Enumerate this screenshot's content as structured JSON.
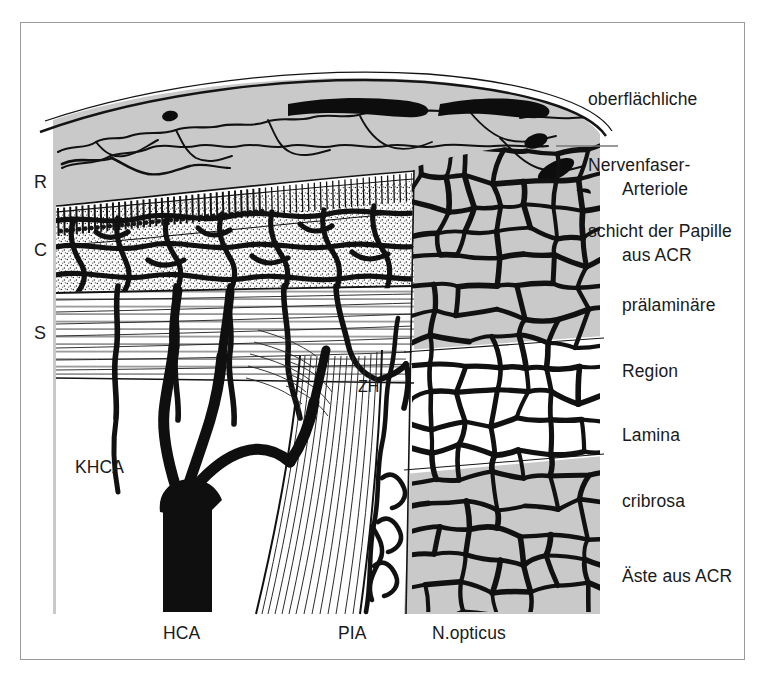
{
  "figure": {
    "background_color": "#ffffff",
    "frame_color": "#9a9a9a",
    "tissue_gray": "#c9c9c9",
    "vessel_black": "#111111",
    "white_fill": "#ffffff"
  },
  "labels": {
    "right": [
      {
        "id": "nerve-fiber-layer",
        "lines": [
          "oberflächliche",
          "Nervenfaser-",
          "schicht der Papille"
        ],
        "x": 588,
        "y": 44,
        "leader": false
      },
      {
        "id": "arteriole-acr",
        "lines": [
          "Arteriole",
          "aus ACR"
        ],
        "x": 622,
        "y": 134,
        "leader": true
      },
      {
        "id": "prelaminar-region",
        "lines": [
          "prälaminäre",
          "Region"
        ],
        "x": 622,
        "y": 250,
        "leader": false
      },
      {
        "id": "lamina-cribrosa",
        "lines": [
          "Lamina",
          "cribrosa"
        ],
        "x": 622,
        "y": 380,
        "leader": false
      },
      {
        "id": "branches-acr",
        "lines": [
          "Äste aus ACR"
        ],
        "x": 622,
        "y": 521,
        "leader": false
      }
    ],
    "left": [
      {
        "id": "retina",
        "text": "R",
        "x": 34,
        "y": 172
      },
      {
        "id": "choroid",
        "text": "C",
        "x": 34,
        "y": 240
      },
      {
        "id": "sclera",
        "text": "S",
        "x": 34,
        "y": 323
      }
    ],
    "inner": [
      {
        "id": "khca",
        "text": "KHCA",
        "x": 75,
        "y": 456
      },
      {
        "id": "zh",
        "text": "ZH",
        "x": 358,
        "y": 378
      }
    ],
    "bottom": [
      {
        "id": "hca",
        "text": "HCA",
        "x": 163,
        "y": 622
      },
      {
        "id": "pia",
        "text": "PIA",
        "x": 338,
        "y": 622
      },
      {
        "id": "n-opticus",
        "text": "N.opticus",
        "x": 432,
        "y": 622
      }
    ]
  },
  "legend_terms": {
    "ACR": "Arteria centralis retinae",
    "HCA": "Hauptstamm der Ziliararterie",
    "KHCA": "Kurze hintere Ziliararterien",
    "ZH": "Zinn-Haller Gefäßkranz",
    "PIA": "Pia mater",
    "R": "Retina",
    "C": "Chorioidea",
    "S": "Sklera"
  }
}
